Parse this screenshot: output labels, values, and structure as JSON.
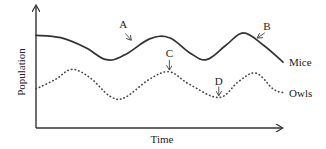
{
  "chart_data": {
    "type": "line",
    "title": "",
    "xlabel": "Time",
    "ylabel": "Population",
    "xlim": [
      0,
      100
    ],
    "ylim": [
      0,
      100
    ],
    "grid": false,
    "legend": "inline labels at right end of each series",
    "units_note": "Axes carry no numeric scale; values are estimated relative units (0-100) read from the curve shapes",
    "series": [
      {
        "name": "Mice",
        "style": "solid",
        "color": "#333333",
        "x": [
          0,
          10,
          20,
          28.5,
          36,
          46,
          54,
          62,
          69,
          77,
          84,
          92,
          100
        ],
        "y": [
          76,
          74,
          66,
          56,
          60,
          73,
          74,
          62,
          56,
          68,
          78,
          68,
          54
        ]
      },
      {
        "name": "Owls",
        "style": "dotted",
        "color": "#333333",
        "x": [
          0,
          8,
          14.5,
          22,
          30,
          36,
          46,
          54,
          62,
          74,
          82,
          89,
          96,
          100
        ],
        "y": [
          32,
          40,
          48,
          41,
          26,
          25,
          40,
          46,
          36,
          25,
          38,
          45,
          32,
          29
        ]
      }
    ],
    "annotations": [
      {
        "label": "A",
        "series": "Mice",
        "x": 39,
        "y": 71,
        "note": "arrow points to rising part of mice curve"
      },
      {
        "label": "B",
        "series": "Mice",
        "x": 89,
        "y": 73,
        "note": "arrow points to falling part of mice curve after peak"
      },
      {
        "label": "C",
        "series": "Owls",
        "x": 54,
        "y": 46,
        "note": "arrow points to owls peak"
      },
      {
        "label": "D",
        "series": "Owls",
        "x": 74,
        "y": 25,
        "note": "arrow points to owls trough"
      }
    ]
  }
}
